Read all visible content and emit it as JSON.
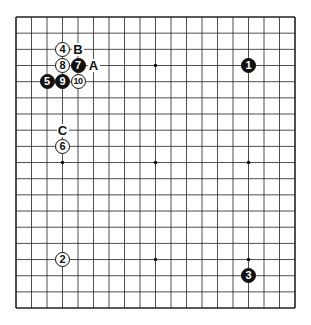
{
  "board": {
    "size": 19,
    "origin_x": 16,
    "origin_y": 17,
    "spacing_x": 15.5,
    "spacing_y": 16.17,
    "line_color": "#222222",
    "star_points": [
      [
        3,
        3
      ],
      [
        9,
        3
      ],
      [
        15,
        3
      ],
      [
        3,
        9
      ],
      [
        9,
        9
      ],
      [
        15,
        9
      ],
      [
        3,
        15
      ],
      [
        9,
        15
      ],
      [
        15,
        15
      ]
    ]
  },
  "stones": [
    {
      "label": "1",
      "color": "black",
      "col": 15,
      "row": 3
    },
    {
      "label": "2",
      "color": "white",
      "col": 3,
      "row": 15
    },
    {
      "label": "3",
      "color": "black",
      "col": 15,
      "row": 16
    },
    {
      "label": "4",
      "color": "white",
      "col": 3,
      "row": 2
    },
    {
      "label": "5",
      "color": "black",
      "col": 2,
      "row": 4
    },
    {
      "label": "6",
      "color": "white",
      "col": 3,
      "row": 8
    },
    {
      "label": "7",
      "color": "black",
      "col": 4,
      "row": 3
    },
    {
      "label": "8",
      "color": "white",
      "col": 3,
      "row": 3
    },
    {
      "label": "9",
      "color": "black",
      "col": 3,
      "row": 4
    },
    {
      "label": "10",
      "color": "white",
      "col": 4,
      "row": 4
    }
  ],
  "markers": [
    {
      "label": "A",
      "col": 5,
      "row": 3
    },
    {
      "label": "B",
      "col": 4,
      "row": 2
    },
    {
      "label": "C",
      "col": 3,
      "row": 7
    }
  ]
}
